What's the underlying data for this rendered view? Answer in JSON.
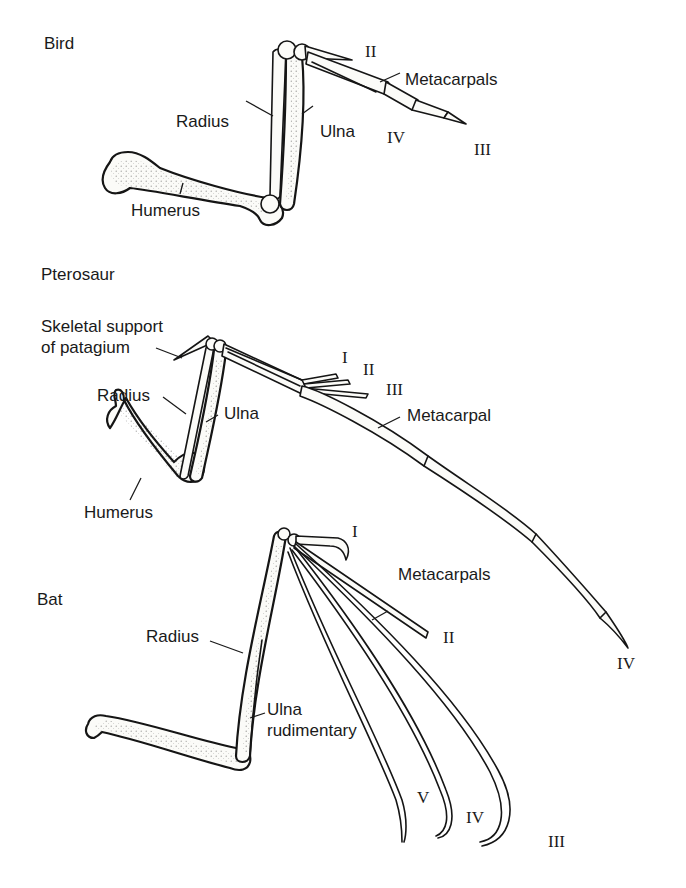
{
  "figure": {
    "panels": [
      {
        "name": "Bird",
        "labels": {
          "radius": "Radius",
          "ulna": "Ulna",
          "humerus": "Humerus",
          "metacarpals": "Metacarpals"
        },
        "digits": [
          "II",
          "III",
          "IV"
        ]
      },
      {
        "name": "Pterosaur",
        "labels": {
          "skeletal_support_line1": "Skeletal support",
          "skeletal_support_line2": "of patagium",
          "radius": "Radius",
          "ulna": "Ulna",
          "humerus": "Humerus",
          "metacarpal": "Metacarpal"
        },
        "digits": [
          "I",
          "II",
          "III",
          "IV"
        ]
      },
      {
        "name": "Bat",
        "labels": {
          "radius": "Radius",
          "ulna_line1": "Ulna",
          "ulna_line2": "rudimentary",
          "metacarpals": "Metacarpals"
        },
        "digits": [
          "I",
          "II",
          "III",
          "IV",
          "V"
        ]
      }
    ]
  }
}
